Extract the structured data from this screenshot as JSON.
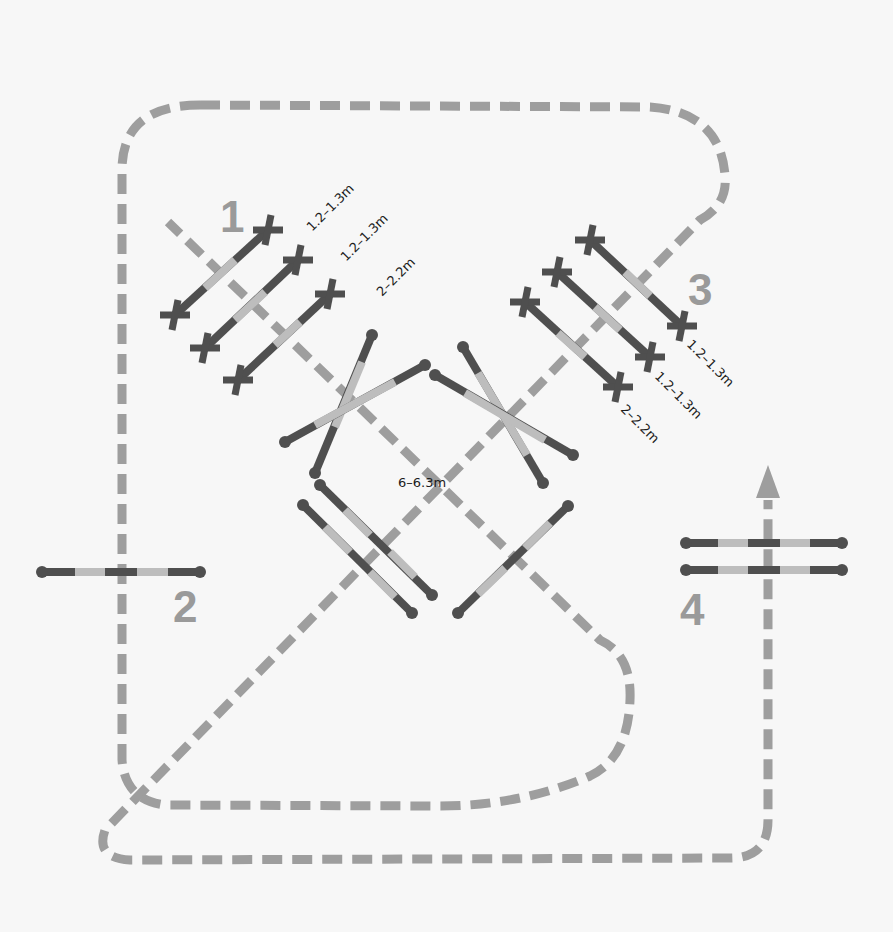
{
  "diagram": {
    "type": "horse jumping exercise course layout",
    "background": "#f7f7f7",
    "colors": {
      "route": "#9e9e9e",
      "pole_dark": "#4f4f4f",
      "pole_light": "#bdbdbd",
      "numbers": "#9a9a9a",
      "labels": "#1c1c1c"
    },
    "fence_numbers": [
      "1",
      "2",
      "3",
      "4"
    ],
    "exercise_1": {
      "number": "1",
      "distances": [
        "1.2–1.3m",
        "1.2–1.3m",
        "2–2.2m"
      ]
    },
    "exercise_3": {
      "number": "3",
      "distances": [
        "1.2–1.3m",
        "1.2–1.3m",
        "2–2.2m"
      ]
    },
    "center": {
      "distance": "6–6.3m"
    },
    "fence_2": {
      "number": "2"
    },
    "fence_4": {
      "number": "4"
    }
  }
}
